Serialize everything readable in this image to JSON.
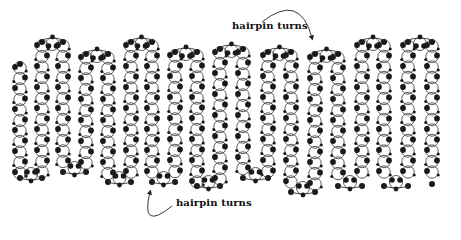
{
  "figure": {
    "labels": {
      "top": "hairpin turns",
      "bottom": "hairpin turns"
    },
    "colors": {
      "ink": "#1a1a1a",
      "line": "#333333",
      "background": "#ffffff"
    },
    "strands": [
      {
        "x": 20,
        "top": 62,
        "bottom": 178
      },
      {
        "x": 42,
        "top": 40,
        "bottom": 178
      },
      {
        "x": 63,
        "top": 40,
        "bottom": 172
      },
      {
        "x": 86,
        "top": 52,
        "bottom": 172
      },
      {
        "x": 108,
        "top": 52,
        "bottom": 182
      },
      {
        "x": 131,
        "top": 40,
        "bottom": 182
      },
      {
        "x": 152,
        "top": 40,
        "bottom": 182
      },
      {
        "x": 175,
        "top": 50,
        "bottom": 182
      },
      {
        "x": 197,
        "top": 50,
        "bottom": 186
      },
      {
        "x": 220,
        "top": 47,
        "bottom": 186
      },
      {
        "x": 243,
        "top": 47,
        "bottom": 178
      },
      {
        "x": 268,
        "top": 50,
        "bottom": 178
      },
      {
        "x": 291,
        "top": 50,
        "bottom": 192
      },
      {
        "x": 315,
        "top": 52,
        "bottom": 192
      },
      {
        "x": 338,
        "top": 52,
        "bottom": 186
      },
      {
        "x": 362,
        "top": 40,
        "bottom": 186
      },
      {
        "x": 384,
        "top": 40,
        "bottom": 186
      },
      {
        "x": 408,
        "top": 40,
        "bottom": 186
      },
      {
        "x": 432,
        "top": 40,
        "bottom": 184
      }
    ],
    "top_turns": [
      [
        1,
        2
      ],
      [
        3,
        4
      ],
      [
        5,
        6
      ],
      [
        7,
        8
      ],
      [
        9,
        10
      ],
      [
        11,
        12
      ],
      [
        13,
        14
      ],
      [
        15,
        16
      ],
      [
        17,
        18
      ]
    ],
    "bottom_turns": [
      [
        0,
        1
      ],
      [
        2,
        3
      ],
      [
        4,
        5
      ],
      [
        6,
        7
      ],
      [
        8,
        9
      ],
      [
        10,
        11
      ],
      [
        12,
        13
      ],
      [
        14,
        15
      ],
      [
        16,
        17
      ]
    ],
    "arrows": {
      "top": {
        "from": [
          262,
          22
        ],
        "ctrl": [
          300,
          -8
        ],
        "to": [
          312,
          38
        ]
      },
      "bottom": {
        "from": [
          172,
          206
        ],
        "ctrl": [
          140,
          232
        ],
        "to": [
          150,
          192
        ]
      }
    }
  }
}
